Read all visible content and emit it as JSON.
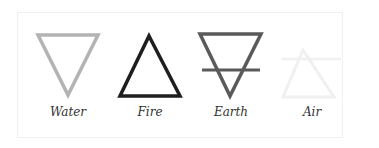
{
  "elements": [
    {
      "name": "Water",
      "symbol": "inverted-triangle",
      "color": "#b3b3b3"
    },
    {
      "name": "Fire",
      "symbol": "upright-triangle",
      "color": "#1e1e1e"
    },
    {
      "name": "Earth",
      "symbol": "inverted-triangle-with-bar",
      "color": "#5a5a5a"
    },
    {
      "name": "Air",
      "symbol": "upright-triangle-with-bar",
      "color": "#f0f0f0"
    }
  ]
}
